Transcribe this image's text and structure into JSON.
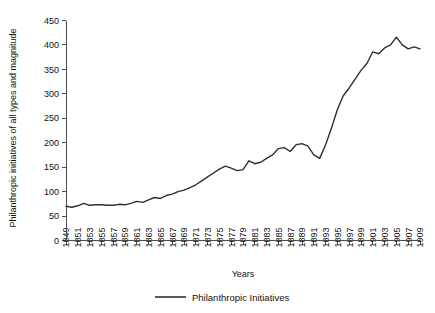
{
  "chart_data": {
    "type": "line",
    "title": "",
    "xlabel": "Years",
    "ylabel": "Philanthropic initiatives of all types and magnitude",
    "ylim": [
      0,
      450
    ],
    "yticks": [
      0,
      50,
      100,
      150,
      200,
      250,
      300,
      350,
      400,
      450
    ],
    "xlim": [
      1849,
      1909
    ],
    "xticks": [
      1849,
      1851,
      1853,
      1855,
      1857,
      1859,
      1861,
      1863,
      1865,
      1867,
      1869,
      1871,
      1873,
      1875,
      1877,
      1879,
      1881,
      1883,
      1885,
      1887,
      1889,
      1891,
      1893,
      1895,
      1897,
      1899,
      1901,
      1903,
      1905,
      1907,
      1909
    ],
    "grid": false,
    "legend_position": "bottom-center",
    "series": [
      {
        "name": "Philanthropic Initiatives",
        "color": "#2f2f2f",
        "x": [
          1849,
          1850,
          1851,
          1852,
          1853,
          1854,
          1855,
          1856,
          1857,
          1858,
          1859,
          1860,
          1861,
          1862,
          1863,
          1864,
          1865,
          1866,
          1867,
          1868,
          1869,
          1870,
          1871,
          1872,
          1873,
          1874,
          1875,
          1876,
          1877,
          1878,
          1879,
          1880,
          1881,
          1882,
          1883,
          1884,
          1885,
          1886,
          1887,
          1888,
          1889,
          1890,
          1891,
          1892,
          1893,
          1894,
          1895,
          1896,
          1897,
          1898,
          1899,
          1900,
          1901,
          1902,
          1903,
          1904,
          1905,
          1906,
          1907,
          1908,
          1909
        ],
        "values": [
          70,
          68,
          71,
          76,
          72,
          73,
          73,
          72,
          72,
          74,
          73,
          76,
          80,
          78,
          83,
          88,
          86,
          92,
          95,
          100,
          103,
          108,
          114,
          122,
          130,
          138,
          146,
          152,
          148,
          143,
          145,
          163,
          157,
          160,
          168,
          175,
          188,
          190,
          182,
          196,
          198,
          193,
          175,
          168,
          196,
          230,
          268,
          296,
          312,
          330,
          348,
          362,
          386,
          382,
          394,
          400,
          416,
          400,
          392,
          396,
          392
        ]
      }
    ]
  },
  "legend": {
    "entries": [
      {
        "label": "Philanthropic Initiatives"
      }
    ]
  },
  "axes": {
    "x_title": "Years",
    "y_title": "Philanthropic initiatives of all types and magnitude"
  }
}
